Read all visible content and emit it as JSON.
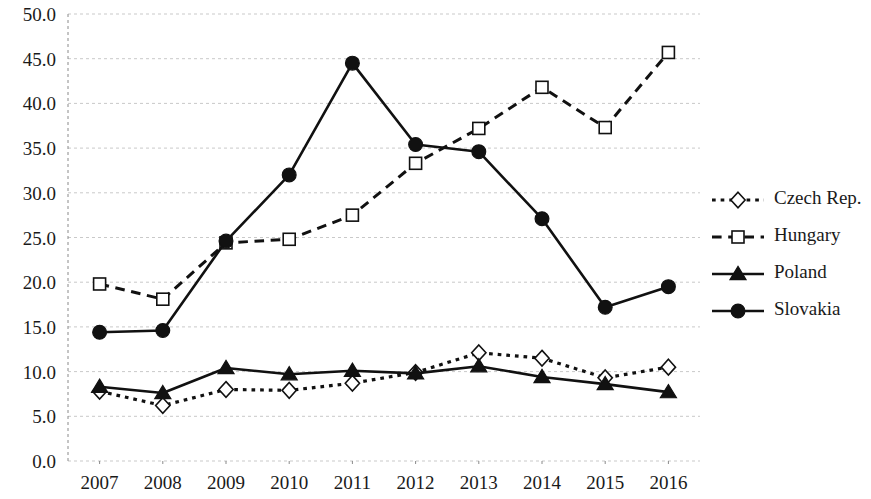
{
  "chart_data": {
    "type": "line",
    "title": "",
    "subtitle": "",
    "xlabel": "",
    "ylabel": "",
    "categories": [
      "2007",
      "2008",
      "2009",
      "2010",
      "2011",
      "2012",
      "2013",
      "2014",
      "2015",
      "2016"
    ],
    "x": [
      2007,
      2008,
      2009,
      2010,
      2011,
      2012,
      2013,
      2014,
      2015,
      2016
    ],
    "ylim": [
      0.0,
      50.0
    ],
    "ytick_step": 5.0,
    "yticks": [
      "0.0",
      "5.0",
      "10.0",
      "15.0",
      "20.0",
      "25.0",
      "30.0",
      "35.0",
      "40.0",
      "45.0",
      "50.0"
    ],
    "ytick_values": [
      0.0,
      5.0,
      10.0,
      15.0,
      20.0,
      25.0,
      30.0,
      35.0,
      40.0,
      45.0,
      50.0
    ],
    "grid": true,
    "grid_style": "dotted-horizontal",
    "legend_position": "right",
    "series": [
      {
        "name": "Czech Rep.",
        "values": [
          7.8,
          6.2,
          8.0,
          7.9,
          8.7,
          9.9,
          12.1,
          11.5,
          9.3,
          10.5
        ],
        "line_style": "dotted",
        "marker": "diamond",
        "marker_fill": "open",
        "color": "#111111"
      },
      {
        "name": "Hungary",
        "values": [
          19.8,
          18.1,
          24.4,
          24.8,
          27.5,
          33.3,
          37.2,
          41.8,
          37.3,
          45.7
        ],
        "line_style": "dashed",
        "marker": "square",
        "marker_fill": "open",
        "color": "#111111"
      },
      {
        "name": "Poland",
        "values": [
          8.3,
          7.6,
          10.4,
          9.7,
          10.1,
          9.8,
          10.6,
          9.4,
          8.6,
          7.7
        ],
        "line_style": "solid",
        "marker": "triangle",
        "marker_fill": "solid",
        "color": "#111111"
      },
      {
        "name": "Slovakia",
        "values": [
          14.4,
          14.6,
          24.6,
          32.0,
          44.5,
          35.4,
          34.6,
          27.1,
          17.2,
          19.5
        ],
        "line_style": "solid",
        "marker": "circle",
        "marker_fill": "solid",
        "color": "#111111"
      }
    ]
  },
  "legend": {
    "items": [
      {
        "label": "Czech Rep."
      },
      {
        "label": "Hungary"
      },
      {
        "label": "Poland"
      },
      {
        "label": "Slovakia"
      }
    ]
  },
  "colors": {
    "ink": "#111111",
    "grid": "#c9c9c9",
    "background": "#ffffff"
  }
}
